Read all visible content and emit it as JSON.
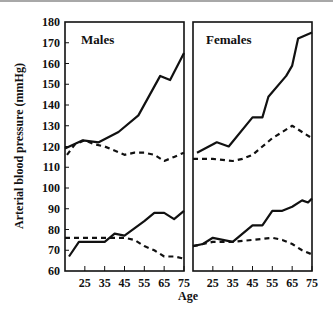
{
  "chart_data": {
    "type": "line",
    "ylabel": "Arterial blood   pressure (mmHg)",
    "xlabel": "Age",
    "ylim": [
      60,
      180
    ],
    "yticks": [
      60,
      70,
      80,
      90,
      100,
      110,
      120,
      130,
      140,
      150,
      160,
      170,
      180
    ],
    "xlim": [
      15,
      75
    ],
    "xticks": [
      25,
      35,
      45,
      55,
      65,
      75
    ],
    "grid": false,
    "legend": "none",
    "panels": [
      {
        "title": "Males",
        "series": [
          {
            "name": "Systolic (solid)",
            "style": "solid",
            "x": [
              15,
              24,
              32,
              42,
              52,
              63,
              68,
              75
            ],
            "y": [
              119,
              123,
              122,
              127,
              135,
              154,
              152,
              165
            ]
          },
          {
            "name": "Systolic (dashed)",
            "style": "dashed",
            "x": [
              16,
              20,
              25,
              30,
              35,
              45,
              50,
              55,
              60,
              65,
              70,
              75
            ],
            "y": [
              116,
              121,
              123,
              121,
              120,
              116,
              117,
              117,
              116,
              113,
              115,
              117
            ]
          },
          {
            "name": "Diastolic (solid)",
            "style": "solid",
            "x": [
              17,
              22,
              27,
              35,
              40,
              45,
              55,
              60,
              65,
              70,
              75
            ],
            "y": [
              67,
              74,
              74,
              74,
              78,
              77,
              84,
              88,
              88,
              85,
              89
            ]
          },
          {
            "name": "Diastolic (dashed)",
            "style": "dashed",
            "x": [
              15,
              25,
              35,
              45,
              50,
              55,
              60,
              65,
              70,
              75
            ],
            "y": [
              76,
              76,
              76,
              76,
              75,
              72,
              70,
              67,
              67,
              66
            ]
          }
        ]
      },
      {
        "title": "Females",
        "series": [
          {
            "name": "Systolic (solid)",
            "style": "solid",
            "x": [
              17,
              27,
              33,
              45,
              50,
              53,
              62,
              65,
              68,
              75
            ],
            "y": [
              117,
              122,
              120,
              134,
              134,
              144,
              154,
              159,
              172,
              175
            ]
          },
          {
            "name": "Systolic (dashed)",
            "style": "dashed",
            "x": [
              15,
              25,
              35,
              40,
              45,
              55,
              65,
              70,
              75
            ],
            "y": [
              114,
              114,
              113,
              114,
              116,
              124,
              130,
              127,
              124
            ]
          },
          {
            "name": "Diastolic (solid)",
            "style": "solid",
            "x": [
              15,
              20,
              25,
              30,
              35,
              45,
              50,
              55,
              60,
              65,
              70,
              73,
              75
            ],
            "y": [
              72,
              73,
              76,
              75,
              74,
              82,
              82,
              89,
              89,
              91,
              94,
              93,
              95
            ]
          },
          {
            "name": "Diastolic (dashed)",
            "style": "dashed",
            "x": [
              15,
              20,
              25,
              35,
              45,
              55,
              60,
              65,
              70,
              75
            ],
            "y": [
              72,
              73,
              74,
              74,
              75,
              76,
              75,
              73,
              70,
              68
            ]
          }
        ]
      }
    ]
  },
  "colors": {
    "line": "#111111",
    "axis": "#111111",
    "topbar": "#a8a8a8"
  }
}
